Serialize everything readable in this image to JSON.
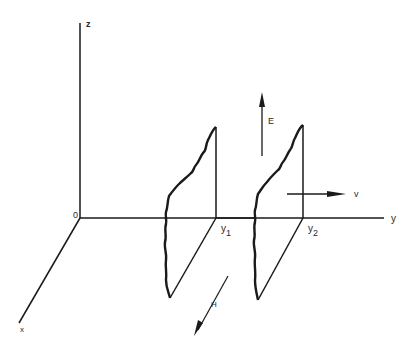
{
  "diagram": {
    "type": "3d-axes-wave-planes",
    "axes": {
      "z_label": "z",
      "y_label": "y",
      "x_label": "x",
      "origin_label": "0"
    },
    "planes": [
      {
        "position_label": "y",
        "subscript": "1"
      },
      {
        "position_label": "y",
        "subscript": "2"
      }
    ],
    "vectors": {
      "electric_field": "E",
      "velocity": "v",
      "magnetic_field": "H"
    },
    "colors": {
      "stroke": "#1a1a1a",
      "background": "#ffffff"
    }
  }
}
